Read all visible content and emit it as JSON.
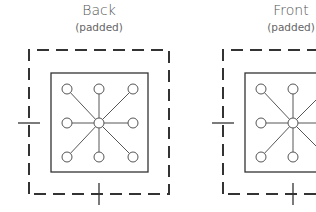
{
  "panels": [
    {
      "title": "Back",
      "subtitle": "(padded)",
      "offset_x": 0
    },
    {
      "title": "Front",
      "subtitle": "(padded)",
      "offset_x": 194
    }
  ],
  "colors": {
    "stroke": "#333333",
    "node_fill": "#ffffff",
    "text": "#555555"
  }
}
